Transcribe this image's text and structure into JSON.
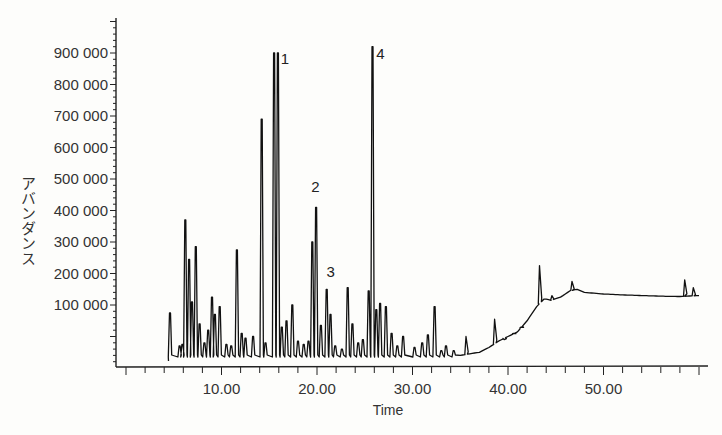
{
  "chart_data": {
    "type": "line",
    "title": "",
    "xlabel": "Time",
    "ylabel": "アバンダンス",
    "xlim": [
      0,
      61
    ],
    "ylim": [
      -80000,
      1000000
    ],
    "grid": false,
    "legend": null,
    "x_ticks": [
      10,
      20,
      30,
      40,
      50
    ],
    "x_tick_labels": [
      "10.00",
      "20.00",
      "30.00",
      "40.00",
      "50.00"
    ],
    "y_ticks": [
      100000,
      200000,
      300000,
      400000,
      500000,
      600000,
      700000,
      800000,
      900000
    ],
    "y_tick_labels": [
      "100 000",
      "200 000",
      "300 000",
      "400 000",
      "500 000",
      "600 000",
      "700 000",
      "800 000",
      "900 000"
    ],
    "baseline": -65000,
    "trace_start": 4.5,
    "trace_end": 60.0,
    "peaks": [
      [
        4.6,
        75000
      ],
      [
        5.6,
        -30000
      ],
      [
        5.9,
        -25000
      ],
      [
        6.2,
        370000
      ],
      [
        6.6,
        245000
      ],
      [
        6.9,
        110000
      ],
      [
        7.3,
        285000
      ],
      [
        7.7,
        40000
      ],
      [
        8.2,
        -20000
      ],
      [
        8.6,
        20000
      ],
      [
        9.0,
        125000
      ],
      [
        9.3,
        70000
      ],
      [
        9.8,
        95000
      ],
      [
        10.5,
        -25000
      ],
      [
        11.0,
        -30000
      ],
      [
        11.6,
        275000
      ],
      [
        12.1,
        10000
      ],
      [
        12.5,
        -5000
      ],
      [
        13.3,
        0
      ],
      [
        14.2,
        690000
      ],
      [
        14.6,
        -20000
      ],
      [
        15.5,
        900000
      ],
      [
        15.9,
        900000
      ],
      [
        16.3,
        30000
      ],
      [
        16.8,
        50000
      ],
      [
        17.4,
        100000
      ],
      [
        18.0,
        -15000
      ],
      [
        18.6,
        -25000
      ],
      [
        19.1,
        -15000
      ],
      [
        19.5,
        300000
      ],
      [
        19.9,
        410000
      ],
      [
        20.4,
        35000
      ],
      [
        21.0,
        150000
      ],
      [
        21.4,
        70000
      ],
      [
        21.9,
        -30000
      ],
      [
        22.6,
        -40000
      ],
      [
        23.2,
        155000
      ],
      [
        23.7,
        40000
      ],
      [
        24.3,
        -20000
      ],
      [
        24.8,
        -10000
      ],
      [
        25.4,
        145000
      ],
      [
        25.8,
        920000
      ],
      [
        26.2,
        85000
      ],
      [
        26.6,
        105000
      ],
      [
        27.2,
        95000
      ],
      [
        27.8,
        10000
      ],
      [
        28.4,
        -30000
      ],
      [
        29.0,
        0
      ],
      [
        30.2,
        -35000
      ],
      [
        31.0,
        -20000
      ],
      [
        31.6,
        5000
      ],
      [
        32.3,
        95000
      ],
      [
        33.0,
        -45000
      ],
      [
        33.5,
        -30000
      ],
      [
        34.3,
        -45000
      ],
      [
        35.6,
        0
      ],
      [
        38.6,
        55000
      ],
      [
        39.6,
        -10000
      ],
      [
        40.6,
        10000
      ],
      [
        41.4,
        30000
      ],
      [
        43.3,
        225000
      ],
      [
        44.6,
        130000
      ],
      [
        46.7,
        175000
      ],
      [
        58.5,
        180000
      ],
      [
        59.4,
        155000
      ]
    ],
    "hump": [
      [
        35.0,
        -60000
      ],
      [
        37.0,
        -50000
      ],
      [
        38.0,
        -35000
      ],
      [
        39.0,
        -15000
      ],
      [
        40.0,
        0
      ],
      [
        41.0,
        15000
      ],
      [
        42.0,
        50000
      ],
      [
        43.0,
        95000
      ],
      [
        43.8,
        120000
      ],
      [
        44.5,
        115000
      ],
      [
        45.5,
        125000
      ],
      [
        46.5,
        145000
      ],
      [
        47.2,
        150000
      ],
      [
        48.0,
        140000
      ],
      [
        50.0,
        135000
      ],
      [
        52.0,
        132000
      ],
      [
        54.0,
        130000
      ],
      [
        56.0,
        128000
      ],
      [
        58.0,
        127000
      ],
      [
        60.0,
        130000
      ]
    ],
    "annotations": [
      {
        "text": "1",
        "x": 16.2,
        "y": 865000
      },
      {
        "text": "2",
        "x": 19.4,
        "y": 460000
      },
      {
        "text": "3",
        "x": 21.0,
        "y": 190000
      },
      {
        "text": "4",
        "x": 26.2,
        "y": 880000
      }
    ]
  },
  "axes": {
    "x_title": "Time",
    "y_title": "アバンダンス"
  }
}
